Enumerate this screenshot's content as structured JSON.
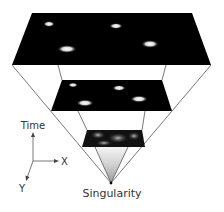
{
  "diagram": {
    "planes": [
      {
        "name": "present",
        "galaxies": 4
      },
      {
        "name": "past",
        "galaxies": 4
      },
      {
        "name": "early",
        "galaxies": 0
      }
    ],
    "apex_label": "Singularity",
    "axes": {
      "time_label": "Time",
      "x_label": "X",
      "y_label": "Y"
    },
    "colors": {
      "plane": "#000000",
      "lines": "#555555",
      "text": "#333333"
    }
  }
}
